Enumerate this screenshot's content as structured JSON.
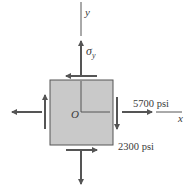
{
  "diagram": {
    "type": "plane-stress-element",
    "axes": {
      "x_label": "x",
      "y_label": "y",
      "origin_label": "O"
    },
    "stresses": {
      "sigma_y_label": "σ",
      "sigma_y_subscript": "y",
      "sigma_x_label": "5700 psi",
      "tau_label": "2300 psi"
    },
    "colors": {
      "element_fill": "#c9c9c9",
      "element_stroke": "#555555",
      "arrow": "#555555",
      "axis": "#555555",
      "text": "#3a3a3a"
    }
  }
}
